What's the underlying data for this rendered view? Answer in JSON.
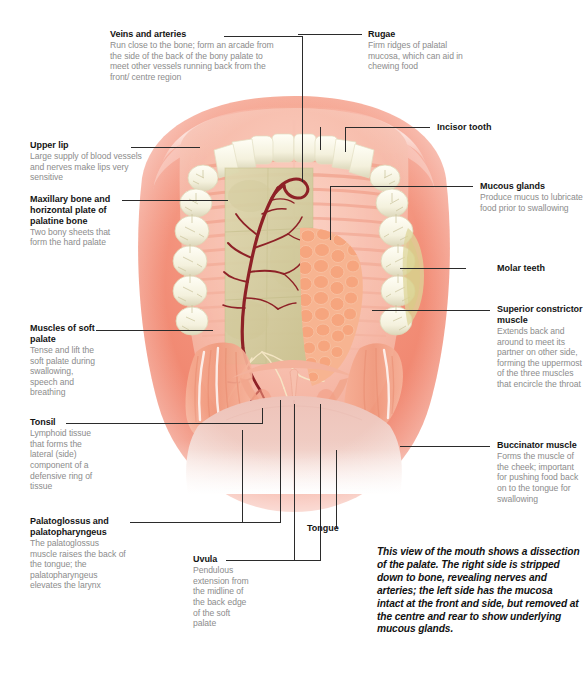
{
  "figure": {
    "caption": "This view of the mouth shows a dissection of the palate. The right side is stripped down to bone, revealing nerves and arteries; the left side has the mucosa intact at the front and side, but removed at the centre and rear to show underlying mucous glands."
  },
  "colors": {
    "heading_text": "#141414",
    "body_text": "#8c8c8c",
    "leader_line": "#2b2b2b",
    "lip_outer": "#f3927c",
    "lip_mid": "#f4a68f",
    "mucosa_pink": "#f5b5a3",
    "palate_pink": "#f7c3b4",
    "tooth_cream": "#f6f4e4",
    "tooth_shadow": "#ddd8bc",
    "bone_olive": "#d6d1a5",
    "artery_dark_red": "#8e2127",
    "gland_nodule": "#f4a883",
    "tongue_pink": "#efc6bd",
    "background": "#ffffff"
  },
  "labels": [
    {
      "id": "veins-and-arteries",
      "heading": "Veins and arteries",
      "body": "Run close to the bone; form an arcade from the side of the back of the bony palate to meet other vessels running back from the front/ centre region"
    },
    {
      "id": "upper-lip",
      "heading": "Upper lip",
      "body": "Large supply of blood vessels and nerves make lips very sensitive"
    },
    {
      "id": "maxillary-bone",
      "heading": "Maxillary bone and horizontal plate of palatine bone",
      "body": "Two bony sheets that form the hard palate"
    },
    {
      "id": "muscles-of-soft-palate",
      "heading": "Muscles of soft palate",
      "body": "Tense and lift the soft palate during swallowing, speech and breathing"
    },
    {
      "id": "tonsil",
      "heading": "Tonsil",
      "body": "Lymphoid tissue that forms the lateral (side) component of a defensive ring of tissue"
    },
    {
      "id": "palatoglossus",
      "heading": "Palatoglossus and palatopharyngeus",
      "body": "The palatoglossus muscle raises the back of the tongue; the palatopharyngeus elevates the larynx"
    },
    {
      "id": "uvula",
      "heading": "Uvula",
      "body": "Pendulous extension from the midline of the back edge of the soft palate"
    },
    {
      "id": "tongue",
      "heading": "Tongue",
      "body": ""
    },
    {
      "id": "rugae",
      "heading": "Rugae",
      "body": "Firm ridges of palatal mucosa, which can aid in chewing food"
    },
    {
      "id": "incisor-tooth",
      "heading": "Incisor tooth",
      "body": ""
    },
    {
      "id": "mucous-glands",
      "heading": "Mucous glands",
      "body": "Produce mucus to lubricate food prior to swallowing"
    },
    {
      "id": "molar-teeth",
      "heading": "Molar teeth",
      "body": ""
    },
    {
      "id": "superior-constrictor",
      "heading": "Superior constrictor muscle",
      "body": "Extends back and around to meet its partner on other side, forming the uppermost of the three muscles that encircle the throat"
    },
    {
      "id": "buccinator",
      "heading": "Buccinator muscle",
      "body": "Forms the muscle of the cheek; important for pushing food back on to the tongue for swallowing"
    }
  ]
}
